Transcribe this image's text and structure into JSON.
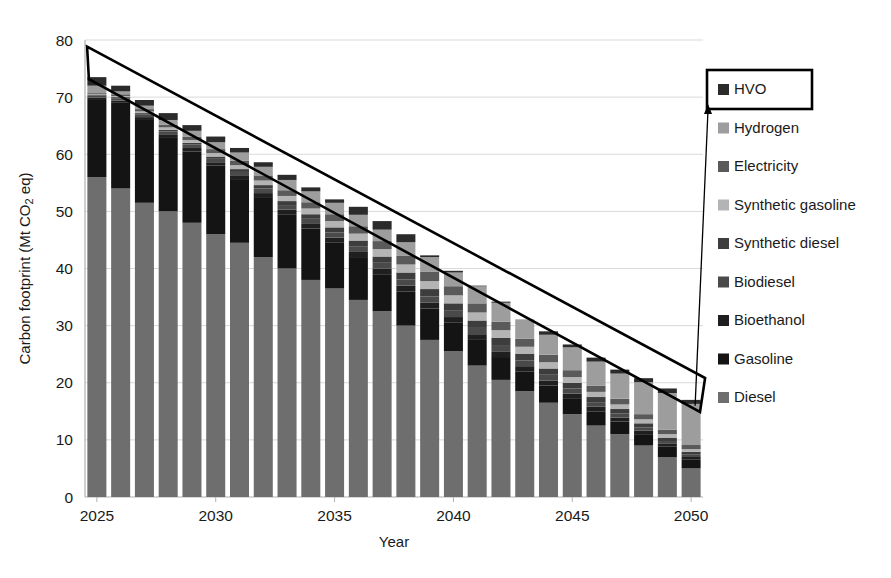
{
  "chart_data": {
    "type": "bar",
    "stacked": true,
    "title": "",
    "xlabel": "Year",
    "ylabel": "Carbon footprint (Mt CO2 eq)",
    "ylabel_parts": {
      "pre": "Carbon footprint (Mt CO",
      "sub": "2",
      "post": " eq)"
    },
    "ylim": [
      0,
      80
    ],
    "yticks": [
      0,
      10,
      20,
      30,
      40,
      50,
      60,
      70,
      80
    ],
    "ytick_labels": [
      "0",
      "10",
      "20",
      "30",
      "40",
      "50",
      "60",
      "70",
      "80"
    ],
    "xlim": [
      2025,
      2050
    ],
    "xticks": [
      2025,
      2030,
      2035,
      2040,
      2045,
      2050
    ],
    "xtick_labels": [
      "2025",
      "2030",
      "2035",
      "2040",
      "2045",
      "2050"
    ],
    "grid": "horizontal",
    "legend_position": "right",
    "categories": [
      2025,
      2026,
      2027,
      2028,
      2029,
      2030,
      2031,
      2032,
      2033,
      2034,
      2035,
      2036,
      2037,
      2038,
      2039,
      2040,
      2041,
      2042,
      2043,
      2044,
      2045,
      2046,
      2047,
      2048,
      2049,
      2050
    ],
    "totals": [
      73.5,
      72.0,
      69.5,
      67.2,
      65.1,
      63.0,
      61.1,
      58.6,
      56.4,
      54.2,
      52.0,
      49.8,
      47.3,
      45.0,
      42.3,
      39.6,
      37.0,
      34.2,
      31.6,
      29.0,
      26.7,
      24.4,
      22.3,
      20.8,
      19.0,
      17.0
    ],
    "series": [
      {
        "name": "Diesel",
        "color": "#6e6e6e",
        "values": [
          56.0,
          54.0,
          51.5,
          50.0,
          48.0,
          46.0,
          44.5,
          42.0,
          40.0,
          38.0,
          36.5,
          34.5,
          32.5,
          30.0,
          27.5,
          25.5,
          23.0,
          20.5,
          18.5,
          16.5,
          14.5,
          12.5,
          11.0,
          9.0,
          7.0,
          5.0
        ]
      },
      {
        "name": "Gasoline",
        "color": "#141414",
        "values": [
          13.5,
          15.0,
          14.5,
          13.0,
          12.5,
          12.0,
          11.0,
          10.5,
          9.5,
          9.0,
          8.0,
          7.5,
          6.5,
          6.0,
          5.5,
          5.0,
          4.5,
          4.0,
          3.5,
          3.0,
          2.8,
          2.5,
          2.2,
          2.0,
          1.8,
          1.6
        ]
      },
      {
        "name": "Bioethanol",
        "color": "#1f1f1f",
        "values": [
          0.4,
          0.4,
          0.5,
          0.5,
          0.6,
          0.6,
          0.7,
          0.7,
          0.8,
          0.8,
          0.9,
          0.9,
          1.0,
          1.0,
          1.0,
          1.0,
          1.0,
          1.0,
          0.9,
          0.9,
          0.8,
          0.8,
          0.7,
          0.6,
          0.5,
          0.4
        ]
      },
      {
        "name": "Biodiesel",
        "color": "#4a4a4a",
        "values": [
          0.4,
          0.4,
          0.5,
          0.5,
          0.6,
          0.6,
          0.7,
          0.8,
          0.8,
          0.9,
          0.9,
          1.0,
          1.0,
          1.1,
          1.1,
          1.1,
          1.1,
          1.1,
          1.0,
          1.0,
          0.9,
          0.8,
          0.7,
          0.6,
          0.5,
          0.4
        ]
      },
      {
        "name": "Synthetic diesel",
        "color": "#3d3d3d",
        "values": [
          0.1,
          0.2,
          0.2,
          0.3,
          0.3,
          0.4,
          0.5,
          0.6,
          0.7,
          0.8,
          0.9,
          1.0,
          1.1,
          1.2,
          1.3,
          1.3,
          1.3,
          1.3,
          1.2,
          1.1,
          1.0,
          0.9,
          0.8,
          0.7,
          0.6,
          0.5
        ]
      },
      {
        "name": "Synthetic gasoline",
        "color": "#b4b4b4",
        "values": [
          0.1,
          0.2,
          0.3,
          0.4,
          0.5,
          0.6,
          0.7,
          0.8,
          0.9,
          1.0,
          1.1,
          1.2,
          1.3,
          1.4,
          1.4,
          1.4,
          1.4,
          1.3,
          1.2,
          1.1,
          1.0,
          0.9,
          0.8,
          0.7,
          0.6,
          0.5
        ]
      },
      {
        "name": "Electricity",
        "color": "#5a5a5a",
        "values": [
          0.2,
          0.3,
          0.4,
          0.5,
          0.6,
          0.7,
          0.8,
          0.9,
          1.0,
          1.1,
          1.2,
          1.3,
          1.4,
          1.5,
          1.6,
          1.6,
          1.6,
          1.5,
          1.4,
          1.3,
          1.2,
          1.1,
          1.0,
          0.9,
          0.8,
          0.7
        ]
      },
      {
        "name": "Hydrogen",
        "color": "#9d9d9d",
        "values": [
          1.3,
          0.5,
          0.6,
          0.8,
          1.0,
          1.2,
          1.4,
          1.5,
          1.8,
          1.9,
          2.0,
          2.0,
          2.0,
          2.4,
          2.6,
          2.4,
          3.0,
          3.3,
          3.4,
          3.5,
          4.0,
          4.2,
          4.4,
          5.6,
          6.4,
          7.2
        ]
      },
      {
        "name": "HVO",
        "color": "#2b2b2b",
        "values": [
          1.5,
          1.0,
          1.0,
          1.2,
          1.0,
          1.0,
          0.8,
          0.8,
          0.9,
          0.7,
          0.6,
          1.4,
          1.5,
          1.4,
          0.3,
          0.3,
          0.1,
          0.2,
          0.0,
          0.6,
          0.5,
          0.7,
          0.7,
          0.7,
          0.8,
          0.7
        ]
      }
    ],
    "annotations": [
      {
        "name": "trend-arrow",
        "type": "tapered-arrow",
        "from": {
          "x": 2025,
          "y": 74.5
        },
        "to": {
          "x": 2050,
          "y": 17.5
        }
      },
      {
        "name": "hvo-callout-line",
        "type": "leader-line",
        "from_legend": "HVO",
        "to": {
          "x": 2050,
          "y": 17.0
        }
      }
    ]
  },
  "legend": {
    "highlighted": "HVO",
    "items": [
      {
        "label": "HVO",
        "color": "#2b2b2b"
      },
      {
        "label": "Hydrogen",
        "color": "#9d9d9d"
      },
      {
        "label": "Electricity",
        "color": "#5a5a5a"
      },
      {
        "label": "Synthetic gasoline",
        "color": "#b4b4b4"
      },
      {
        "label": "Synthetic diesel",
        "color": "#3d3d3d"
      },
      {
        "label": "Biodiesel",
        "color": "#4a4a4a"
      },
      {
        "label": "Bioethanol",
        "color": "#1f1f1f"
      },
      {
        "label": "Gasoline",
        "color": "#141414"
      },
      {
        "label": "Diesel",
        "color": "#6e6e6e"
      }
    ]
  },
  "style": {
    "grid_color": "#d9d9d9",
    "axis_color": "#b0b0b0",
    "text_color": "#1a1a1a",
    "background": "#ffffff",
    "annotation_color": "#000000"
  }
}
